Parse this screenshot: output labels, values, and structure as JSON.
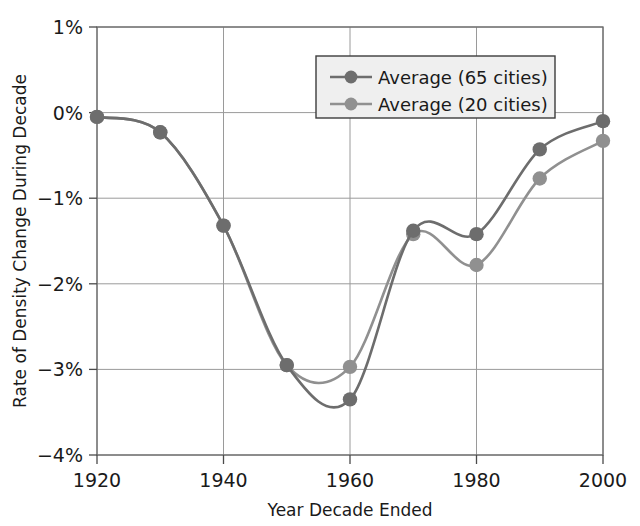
{
  "chart_data": {
    "type": "line",
    "title": "",
    "xlabel": "Year Decade Ended",
    "ylabel": "Rate of Density Change During Decade",
    "x": [
      1920,
      1930,
      1940,
      1950,
      1960,
      1970,
      1980,
      1990,
      2000
    ],
    "xlim": [
      1920,
      2000
    ],
    "ylim": [
      -4,
      1
    ],
    "xticks": [
      1920,
      1940,
      1960,
      1980,
      2000
    ],
    "xtick_labels": [
      "1920",
      "1940",
      "1960",
      "1980",
      "2000"
    ],
    "yticks": [
      1,
      0,
      -1,
      -2,
      -3,
      -4
    ],
    "ytick_labels": [
      "1%",
      "0%",
      "−1%",
      "−2%",
      "−3%",
      "−4%"
    ],
    "grid": true,
    "legend_position": "upper right",
    "series": [
      {
        "name": "Average (65 cities)",
        "color": "#6d6d6d",
        "values": [
          -0.05,
          -0.23,
          -1.32,
          -2.95,
          -3.35,
          -1.38,
          -1.42,
          -0.43,
          -0.1
        ]
      },
      {
        "name": "Average (20 cities)",
        "color": "#909090",
        "values": [
          -0.05,
          -0.23,
          -1.32,
          -2.95,
          -2.97,
          -1.42,
          -1.78,
          -0.77,
          -0.33
        ]
      }
    ]
  },
  "legend": {
    "entries": [
      {
        "label": "Average (65 cities)"
      },
      {
        "label": "Average (20 cities)"
      }
    ]
  },
  "axes": {
    "x_title": "Year Decade Ended",
    "y_title": "Rate of Density Change During Decade"
  }
}
